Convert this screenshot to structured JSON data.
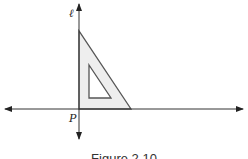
{
  "figure": {
    "caption": "Figure 2.10",
    "line_label": "ℓ",
    "point_label": "P",
    "colors": {
      "line": "#333333",
      "triangle_stroke": "#555555",
      "triangle_fill": "#eeeeee",
      "background": "#ffffff"
    }
  }
}
